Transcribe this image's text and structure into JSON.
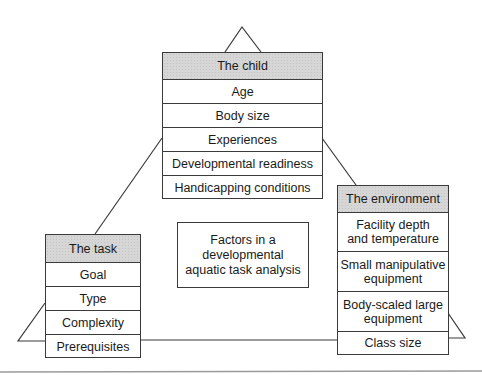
{
  "diagram": {
    "title": "Factors in a developmental aquatic task analysis",
    "center_label": {
      "line1": "Factors in a",
      "line2": "developmental",
      "line3": "aquatic task analysis"
    },
    "child": {
      "header": "The child",
      "items": [
        "Age",
        "Body size",
        "Experiences",
        "Developmental readiness",
        "Handicapping conditions"
      ]
    },
    "task": {
      "header": "The task",
      "items": [
        "Goal",
        "Type",
        "Complexity",
        "Prerequisites"
      ]
    },
    "environment": {
      "header": "The environment",
      "items": [
        {
          "line1": "Facility depth",
          "line2": "and temperature"
        },
        {
          "line1": "Small manipulative",
          "line2": "equipment"
        },
        {
          "line1": "Body-scaled large",
          "line2": "equipment"
        },
        {
          "line1": "Class size",
          "line2": ""
        }
      ]
    },
    "colors": {
      "header_fill": "#d6d6d6",
      "line": "#3a3a3a",
      "background": "#ffffff"
    }
  }
}
